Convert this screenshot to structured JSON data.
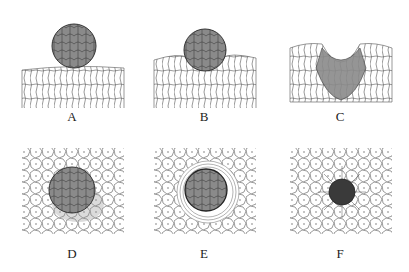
{
  "figure": {
    "panels": [
      {
        "id": "A",
        "label": "A",
        "description": "Spherical cell cluster resting on top of flat epithelial surface (side view)"
      },
      {
        "id": "B",
        "label": "B",
        "description": "Cluster sinking into epithelium, surface cells bending around it (side view)"
      },
      {
        "id": "C",
        "label": "C",
        "description": "Cluster cells invaginating into tissue forming a cup-shaped depression (side view)"
      },
      {
        "id": "D",
        "label": "D",
        "description": "Top view of cluster on polygonal epithelial cell sheet"
      },
      {
        "id": "E",
        "label": "E",
        "description": "Top view of cluster embedding with concentric ring of cells around it"
      },
      {
        "id": "F",
        "label": "F",
        "description": "Top view of small dark spot with radially arranged surrounding cells"
      }
    ],
    "colors": {
      "cluster_fill": "#8a8a8a",
      "cluster_dark": "#4a4a4a",
      "cell_outline": "#555555",
      "background": "#ffffff"
    }
  }
}
